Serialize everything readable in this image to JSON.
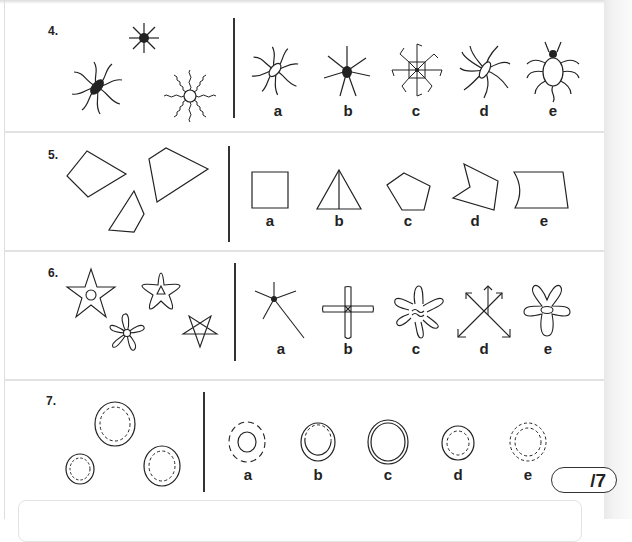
{
  "questions": [
    {
      "number": "4.",
      "given_figures": [
        "spider-curvy-legs-filled-oval",
        "star-burst-filled-dot",
        "wavy-ray-sun-open-circle"
      ],
      "options": [
        {
          "label": "a",
          "figure": "curvy-legs-open-oval"
        },
        {
          "label": "b",
          "figure": "star-burst-filled-dot"
        },
        {
          "label": "c",
          "figure": "square-with-bent-legs"
        },
        {
          "label": "d",
          "figure": "swirl-petals-open-oval"
        },
        {
          "label": "e",
          "figure": "bug-with-head-and-legs"
        }
      ]
    },
    {
      "number": "5.",
      "given_figures": [
        "quadrilateral-kite",
        "quadrilateral-large",
        "quadrilateral-small"
      ],
      "options": [
        {
          "label": "a",
          "figure": "rectangle"
        },
        {
          "label": "b",
          "figure": "triangle-with-median"
        },
        {
          "label": "c",
          "figure": "pentagon"
        },
        {
          "label": "d",
          "figure": "concave-pentagon"
        },
        {
          "label": "e",
          "figure": "curved-side-quadrilateral"
        }
      ]
    },
    {
      "number": "6.",
      "given_figures": [
        "star-with-circle",
        "rounded-star-with-triangle",
        "five-petal-flower",
        "pentagram"
      ],
      "options": [
        {
          "label": "a",
          "figure": "five-lines-dot"
        },
        {
          "label": "b",
          "figure": "rounded-cross"
        },
        {
          "label": "c",
          "figure": "six-arm-wavy-star"
        },
        {
          "label": "d",
          "figure": "crossed-arrows"
        },
        {
          "label": "e",
          "figure": "five-arm-rounded-oval"
        }
      ]
    },
    {
      "number": "7.",
      "given_figures": [
        "double-circle-dashed-inner-large",
        "double-circle-dashed-inner-small",
        "double-circle-dashed-inner-medium"
      ],
      "options": [
        {
          "label": "a",
          "figure": "dashed-outer-solid-inner"
        },
        {
          "label": "b",
          "figure": "solid-outer-dashed-inner-arc"
        },
        {
          "label": "c",
          "figure": "double-solid-circle"
        },
        {
          "label": "d",
          "figure": "solid-outer-dashed-inner"
        },
        {
          "label": "e",
          "figure": "double-dashed-circle"
        }
      ]
    }
  ],
  "score": {
    "text": "/7",
    "total": 7
  },
  "colors": {
    "ink": "#222222",
    "rule": "#e2e2e2",
    "page_edge": "#ececec"
  }
}
